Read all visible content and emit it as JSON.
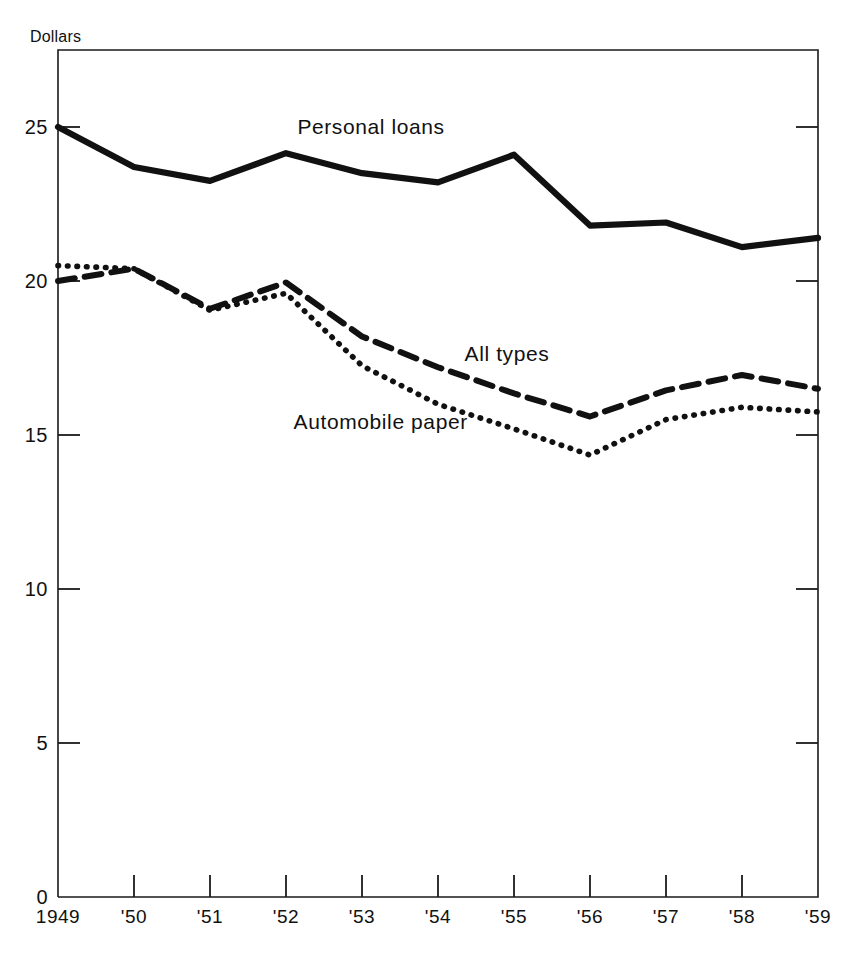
{
  "chart_data": {
    "type": "line",
    "title": "",
    "subtitle": "",
    "xlabel": "",
    "ylabel": "Dollars",
    "unit_label": "Dollars",
    "x": [
      1949,
      1950,
      1951,
      1952,
      1953,
      1954,
      1955,
      1956,
      1957,
      1958,
      1959
    ],
    "categories": [
      "1949",
      "'50",
      "'51",
      "'52",
      "'53",
      "'54",
      "'55",
      "'56",
      "'57",
      "'58",
      "'59"
    ],
    "xlim": [
      1949,
      1959
    ],
    "ylim": [
      0,
      27.5
    ],
    "yticks": [
      0,
      5,
      10,
      15,
      20,
      25
    ],
    "ytick_labels": [
      "0",
      "5",
      "10",
      "15",
      "20",
      "25"
    ],
    "grid": false,
    "legend": "inline-annotations",
    "legend_position": "inline",
    "series": [
      {
        "name": "Personal loans",
        "style": "solid",
        "color": "#111111",
        "label_x": 1952.15,
        "label_y": 24.95,
        "values": [
          25.0,
          23.7,
          23.25,
          24.15,
          23.5,
          23.2,
          24.1,
          21.8,
          21.9,
          21.1,
          21.4
        ]
      },
      {
        "name": "All types",
        "style": "dashed",
        "color": "#111111",
        "label_x": 1954.35,
        "label_y": 17.55,
        "values": [
          20.0,
          20.4,
          19.1,
          19.95,
          18.2,
          17.2,
          16.35,
          15.6,
          16.45,
          16.95,
          16.5
        ]
      },
      {
        "name": "Automobile paper",
        "style": "dotted",
        "color": "#111111",
        "label_x": 1952.1,
        "label_y": 15.35,
        "values": [
          20.5,
          20.4,
          19.05,
          19.6,
          17.25,
          16.0,
          15.2,
          14.35,
          15.5,
          15.9,
          15.75
        ]
      }
    ]
  },
  "axis": {
    "unit_label": "Dollars",
    "y_tick_labels": [
      "25",
      "20",
      "15",
      "10",
      "5",
      "0"
    ],
    "x_tick_labels": [
      "1949",
      "'50",
      "'51",
      "'52",
      "'53",
      "'54",
      "'55",
      "'56",
      "'57",
      "'58",
      "'59"
    ]
  }
}
